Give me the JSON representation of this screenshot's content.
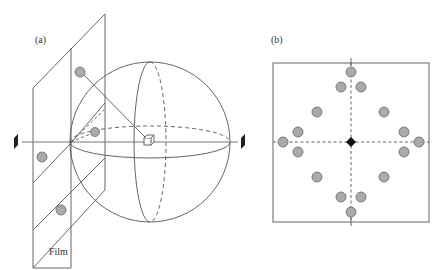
{
  "panels": {
    "a": {
      "label": "(a)",
      "film_label": "Film",
      "description": "Film planes beside a sphere with a cube at center; projection rays to film spots"
    },
    "b": {
      "label": "(b)",
      "description": "Square film with dashed crosshair, central diamond and 16 gray spots"
    }
  },
  "colors": {
    "line": "#555555",
    "spot_fill": "#aaaaaa",
    "spot_stroke": "#666666",
    "marker": "#222222"
  },
  "spots_b": [
    [
      351,
      72
    ],
    [
      341,
      87
    ],
    [
      361,
      87
    ],
    [
      317,
      112
    ],
    [
      384,
      112
    ],
    [
      298,
      132
    ],
    [
      404,
      132
    ],
    [
      283,
      142
    ],
    [
      419,
      142
    ],
    [
      298,
      152
    ],
    [
      404,
      152
    ],
    [
      317,
      177
    ],
    [
      384,
      177
    ],
    [
      341,
      197
    ],
    [
      361,
      197
    ],
    [
      351,
      212
    ]
  ]
}
